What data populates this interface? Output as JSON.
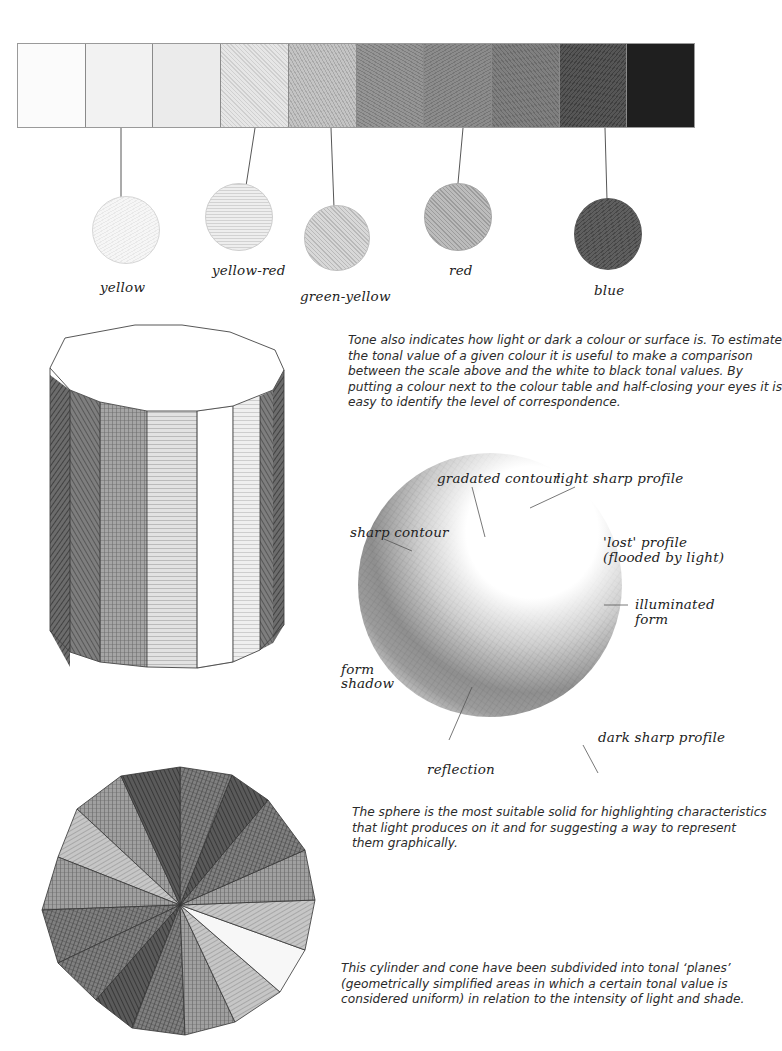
{
  "tonal_scale": {
    "cells": [
      {
        "index": 1,
        "tone": "#fbfbfb"
      },
      {
        "index": 2,
        "tone": "#f2f2f2"
      },
      {
        "index": 3,
        "tone": "#ebebeb"
      },
      {
        "index": 4,
        "tone": "#d6d6d6"
      },
      {
        "index": 5,
        "tone": "#b9b9b9"
      },
      {
        "index": 6,
        "tone": "#8e8e8e"
      },
      {
        "index": 7,
        "tone": "#858585"
      },
      {
        "index": 8,
        "tone": "#7a7a7a"
      },
      {
        "index": 9,
        "tone": "#4e4e4e"
      },
      {
        "index": 10,
        "tone": "#1e1e1e"
      }
    ]
  },
  "colour_swatches": [
    {
      "label": "yellow",
      "tone": "#f3f3f3"
    },
    {
      "label": "yellow-red",
      "tone": "#e4e4e4"
    },
    {
      "label": "green-yellow",
      "tone": "#cfcfcf"
    },
    {
      "label": "red",
      "tone": "#b4b4b4"
    },
    {
      "label": "blue",
      "tone": "#5c5c5c"
    }
  ],
  "tone_paragraph": {
    "lines": [
      "Tone also indicates how light or dark a colour or surface is. To estimate",
      "the tonal value of a given colour it is useful to make a comparison",
      "between the scale above and the white to black tonal values. By",
      "putting a colour next to the colour table  and half-closing your eyes it is",
      "easy to identify the level of correspondence."
    ]
  },
  "sphere_labels": {
    "gradated_contour": "gradated contour",
    "light_sharp_profile": "light sharp profile",
    "sharp_contour": "sharp contour",
    "lost_profile_1": "'lost' profile",
    "lost_profile_2": "(flooded by light)",
    "illuminated_1": "illuminated",
    "illuminated_2": "form",
    "form_shadow_1": "form",
    "form_shadow_2": "shadow",
    "dark_sharp_profile": "dark sharp profile",
    "reflection": "reflection"
  },
  "sphere_paragraph": {
    "lines": [
      "The sphere is the most suitable solid for highlighting characteristics",
      "that light produces on it and for suggesting a way to represent",
      "them graphically."
    ]
  },
  "planes_paragraph": {
    "lines": [
      "This cylinder and cone have been subdivided into tonal ‘planes’",
      "(geometrically simplified areas in which a certain tonal value is",
      "considered uniform) in relation to the intensity of light and shade."
    ]
  }
}
